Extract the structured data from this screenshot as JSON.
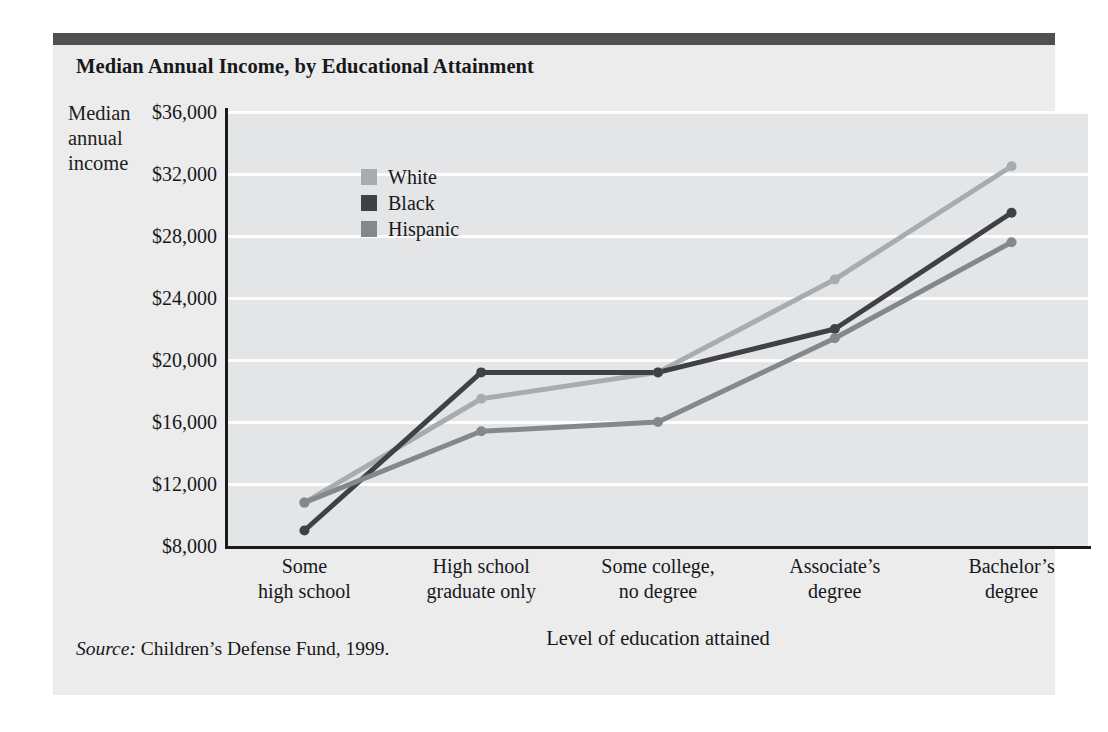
{
  "card": {
    "title": "Median Annual Income, by Educational Attainment",
    "source_prefix": "Source:",
    "source_text": "Children’s Defense Fund, 1999.",
    "topbar_color": "#4f5052",
    "background_color": "#ececed"
  },
  "legend": {
    "position": "inside-top-left",
    "entries": [
      {
        "label": "White",
        "color": "#a9acae"
      },
      {
        "label": "Black",
        "color": "#3f4144"
      },
      {
        "label": "Hispanic",
        "color": "#85888b"
      }
    ]
  },
  "chart_data": {
    "type": "line",
    "title": "Median Annual Income, by Educational Attainment",
    "xlabel": "Level of education attained",
    "ylabel": "Median annual income",
    "ylabel_lines": "Median\nannual\nincome",
    "categories": [
      "Some\nhigh school",
      "High school\ngraduate only",
      "Some college,\nno degree",
      "Associate’s\ndegree",
      "Bachelor’s\ndegree"
    ],
    "categories_flat": [
      "Some high school",
      "High school graduate only",
      "Some college, no degree",
      "Associate’s degree",
      "Bachelor’s degree"
    ],
    "ylim": [
      8000,
      36000
    ],
    "ytick_values": [
      8000,
      12000,
      16000,
      20000,
      24000,
      28000,
      32000,
      36000
    ],
    "ytick_labels": [
      "$8,000",
      "$12,000",
      "$16,000",
      "$20,000",
      "$24,000",
      "$28,000",
      "$32,000",
      "$36,000"
    ],
    "grid": true,
    "grid_color": "#fdfdfd",
    "plot_background": "#e4e5e6",
    "markers": true,
    "series": [
      {
        "name": "White",
        "color": "#a9acae",
        "values": [
          10800,
          17500,
          19200,
          25200,
          32500
        ]
      },
      {
        "name": "Black",
        "color": "#3f4144",
        "values": [
          9000,
          19200,
          19200,
          22000,
          29500
        ]
      },
      {
        "name": "Hispanic",
        "color": "#85888b",
        "values": [
          10800,
          15400,
          16000,
          21400,
          27600
        ]
      }
    ]
  }
}
